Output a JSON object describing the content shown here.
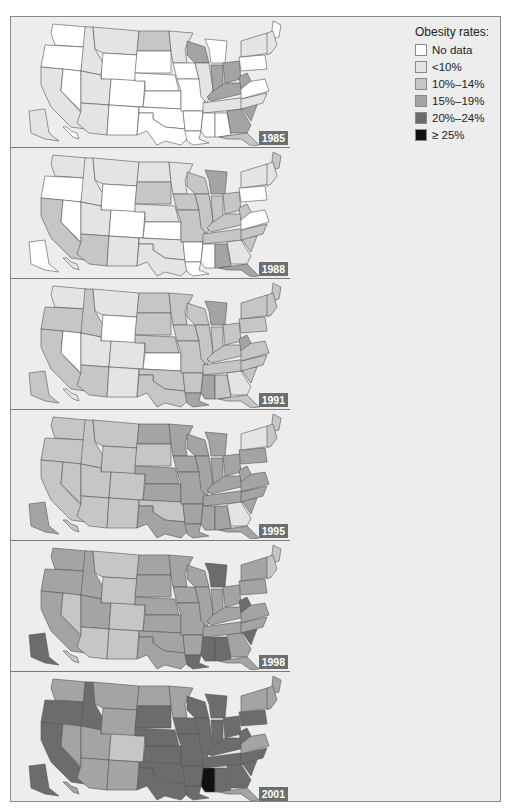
{
  "legend": {
    "title": "Obesity rates:",
    "items": [
      {
        "label": "No data",
        "color": "#ffffff"
      },
      {
        "label": "<10%",
        "color": "#e4e4e4"
      },
      {
        "label": "10%–14%",
        "color": "#c6c6c6"
      },
      {
        "label": "15%–19%",
        "color": "#a4a4a4"
      },
      {
        "label": "20%–24%",
        "color": "#6c6c6c"
      },
      {
        "label": "≥ 25%",
        "color": "#111111"
      }
    ]
  },
  "panels": [
    {
      "year": "1985"
    },
    {
      "year": "1988"
    },
    {
      "year": "1991"
    },
    {
      "year": "1995"
    },
    {
      "year": "1998"
    },
    {
      "year": "2001"
    }
  ],
  "chart_data": {
    "type": "choropleth",
    "legend_categories": [
      "No data",
      "<10%",
      "10%–14%",
      "15%–19%",
      "20%–24%",
      "≥ 25%"
    ],
    "years": [
      "1985",
      "1988",
      "1991",
      "1995",
      "1998",
      "2001"
    ],
    "states": {
      "WA": [
        0,
        1,
        1,
        2,
        3,
        3
      ],
      "OR": [
        0,
        0,
        2,
        2,
        3,
        4
      ],
      "CA": [
        1,
        2,
        2,
        2,
        3,
        4
      ],
      "NV": [
        0,
        0,
        0,
        2,
        2,
        3
      ],
      "ID": [
        1,
        1,
        2,
        2,
        3,
        4
      ],
      "MT": [
        1,
        1,
        1,
        2,
        2,
        3
      ],
      "WY": [
        0,
        0,
        0,
        2,
        2,
        3
      ],
      "UT": [
        1,
        1,
        1,
        2,
        3,
        3
      ],
      "AZ": [
        1,
        2,
        2,
        2,
        2,
        3
      ],
      "CO": [
        0,
        0,
        1,
        2,
        2,
        2
      ],
      "NM": [
        0,
        1,
        1,
        2,
        2,
        3
      ],
      "ND": [
        2,
        1,
        2,
        3,
        3,
        3
      ],
      "SD": [
        0,
        2,
        2,
        2,
        3,
        4
      ],
      "NE": [
        0,
        1,
        2,
        3,
        3,
        4
      ],
      "KS": [
        0,
        0,
        0,
        3,
        3,
        4
      ],
      "OK": [
        0,
        1,
        2,
        2,
        3,
        4
      ],
      "TX": [
        0,
        1,
        2,
        3,
        3,
        4
      ],
      "MN": [
        1,
        1,
        2,
        3,
        3,
        3
      ],
      "IA": [
        0,
        2,
        2,
        3,
        3,
        4
      ],
      "MO": [
        0,
        2,
        2,
        3,
        3,
        4
      ],
      "AR": [
        0,
        0,
        2,
        3,
        3,
        4
      ],
      "LA": [
        0,
        0,
        3,
        3,
        4,
        4
      ],
      "WI": [
        3,
        2,
        2,
        3,
        3,
        4
      ],
      "IL": [
        1,
        2,
        2,
        3,
        3,
        4
      ],
      "MI": [
        0,
        3,
        3,
        3,
        4,
        4
      ],
      "IN": [
        3,
        2,
        2,
        3,
        3,
        4
      ],
      "OH": [
        3,
        2,
        2,
        3,
        3,
        4
      ],
      "KY": [
        3,
        2,
        2,
        3,
        3,
        4
      ],
      "TN": [
        1,
        2,
        2,
        3,
        3,
        4
      ],
      "MS": [
        0,
        0,
        3,
        3,
        4,
        5
      ],
      "AL": [
        0,
        3,
        2,
        3,
        4,
        4
      ],
      "GA": [
        3,
        1,
        1,
        1,
        3,
        4
      ],
      "FL": [
        2,
        3,
        2,
        3,
        3,
        3
      ],
      "SC": [
        3,
        2,
        2,
        3,
        4,
        4
      ],
      "NC": [
        1,
        2,
        2,
        3,
        3,
        4
      ],
      "VA": [
        0,
        0,
        2,
        3,
        3,
        3
      ],
      "WV": [
        3,
        2,
        3,
        3,
        4,
        4
      ],
      "PA": [
        0,
        0,
        2,
        3,
        3,
        4
      ],
      "NY": [
        1,
        1,
        2,
        1,
        3,
        3
      ],
      "ME": [
        0,
        2,
        2,
        2,
        2,
        3
      ],
      "NE_states": [
        1,
        1,
        2,
        2,
        2,
        3
      ],
      "AK": [
        1,
        0,
        2,
        3,
        4,
        4
      ],
      "HI": [
        0,
        1,
        1,
        2,
        2,
        3
      ]
    }
  }
}
